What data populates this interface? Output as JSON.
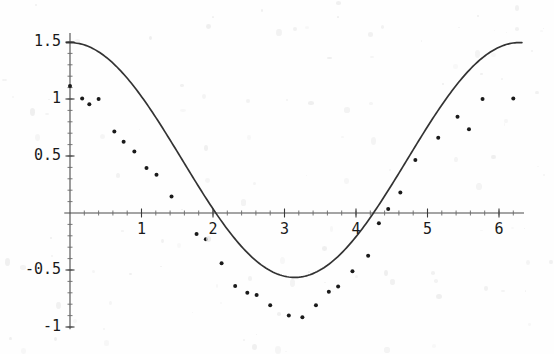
{
  "chart_data": {
    "type": "scatter",
    "title": "",
    "subtitle": "",
    "xlabel": "",
    "ylabel": "",
    "xlim": [
      -0.08,
      6.35
    ],
    "ylim": [
      -1.02,
      1.58
    ],
    "grid": false,
    "legend": null,
    "axis_style": "crossing-axes-at-origin",
    "x_ticks_major": [
      1,
      2,
      3,
      4,
      5,
      6
    ],
    "x_tick_labels": [
      "1",
      "2",
      "3",
      "4",
      "5",
      "6"
    ],
    "x_ticks_minor_step": 0.2,
    "y_ticks_major": [
      -1,
      -0.5,
      0.5,
      1,
      1.5
    ],
    "y_tick_labels": [
      "-1",
      "-0.5",
      "0.5",
      "1",
      "1.5"
    ],
    "y_ticks_minor_step": 0.1,
    "series": [
      {
        "name": "fitted curve",
        "type": "line",
        "color": "#333333",
        "formula": "y = 1.03*cos(x) + 0.465",
        "x_start": -0.05,
        "x_end": 6.32,
        "samples": 260
      },
      {
        "name": "data points",
        "type": "scatter",
        "color": "#1a1a1a",
        "marker": "dot",
        "marker_size_px": 4,
        "points": [
          [
            0.0,
            1.115
          ],
          [
            0.17,
            1.005
          ],
          [
            0.27,
            0.955
          ],
          [
            0.4,
            1.0
          ],
          [
            0.62,
            0.715
          ],
          [
            0.75,
            0.625
          ],
          [
            0.9,
            0.54
          ],
          [
            1.07,
            0.395
          ],
          [
            1.21,
            0.335
          ],
          [
            1.42,
            0.145
          ],
          [
            1.77,
            -0.185
          ],
          [
            1.9,
            -0.23
          ],
          [
            2.12,
            -0.44
          ],
          [
            2.31,
            -0.64
          ],
          [
            2.48,
            -0.7
          ],
          [
            2.61,
            -0.72
          ],
          [
            2.8,
            -0.81
          ],
          [
            3.06,
            -0.9
          ],
          [
            3.25,
            -0.915
          ],
          [
            3.44,
            -0.81
          ],
          [
            3.62,
            -0.69
          ],
          [
            3.75,
            -0.645
          ],
          [
            3.95,
            -0.51
          ],
          [
            4.17,
            -0.375
          ],
          [
            4.32,
            -0.09
          ],
          [
            4.45,
            0.035
          ],
          [
            4.62,
            0.18
          ],
          [
            4.83,
            0.465
          ],
          [
            5.15,
            0.66
          ],
          [
            5.42,
            0.845
          ],
          [
            5.58,
            0.735
          ],
          [
            5.77,
            1.0
          ],
          [
            6.2,
            1.005
          ]
        ]
      }
    ]
  },
  "axes": {
    "origin_px": {
      "x": 70,
      "y": 213
    },
    "x_scale_px_per_unit": 71.5,
    "y_scale_px_per_unit": 114
  }
}
